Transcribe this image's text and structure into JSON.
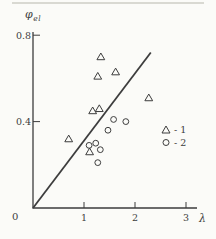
{
  "figure": {
    "y_axis_label": {
      "base": "φ",
      "sub": "el"
    },
    "x_axis_label": "λ",
    "origin_label": "0",
    "ink_color": "#3d3d3d",
    "background_color": "#fbfbf8"
  },
  "legend": {
    "items": [
      {
        "marker": "triangle",
        "label": "- 1",
        "series": "1"
      },
      {
        "marker": "circle",
        "label": "- 2",
        "series": "2"
      }
    ]
  },
  "chart_data": {
    "type": "scatter",
    "title": "",
    "xlabel": "λ",
    "ylabel": "φel",
    "xlim": [
      0,
      3.2
    ],
    "ylim": [
      0,
      0.82
    ],
    "x_ticks": [
      1,
      2,
      3
    ],
    "y_ticks": [
      0.4,
      0.8
    ],
    "grid": false,
    "legend_position": "right-middle",
    "series": [
      {
        "name": "1",
        "marker": "triangle",
        "points": [
          [
            1.33,
            0.7
          ],
          [
            1.27,
            0.61
          ],
          [
            1.62,
            0.63
          ],
          [
            2.27,
            0.51
          ],
          [
            1.17,
            0.45
          ],
          [
            1.3,
            0.46
          ],
          [
            0.7,
            0.32
          ],
          [
            1.11,
            0.26
          ]
        ]
      },
      {
        "name": "2",
        "marker": "circle",
        "points": [
          [
            1.58,
            0.41
          ],
          [
            1.82,
            0.4
          ],
          [
            1.47,
            0.36
          ],
          [
            1.23,
            0.3
          ],
          [
            1.1,
            0.29
          ],
          [
            1.32,
            0.27
          ],
          [
            1.27,
            0.21
          ]
        ]
      }
    ],
    "line": {
      "from": [
        0,
        0
      ],
      "to": [
        2.31,
        0.72
      ]
    }
  }
}
